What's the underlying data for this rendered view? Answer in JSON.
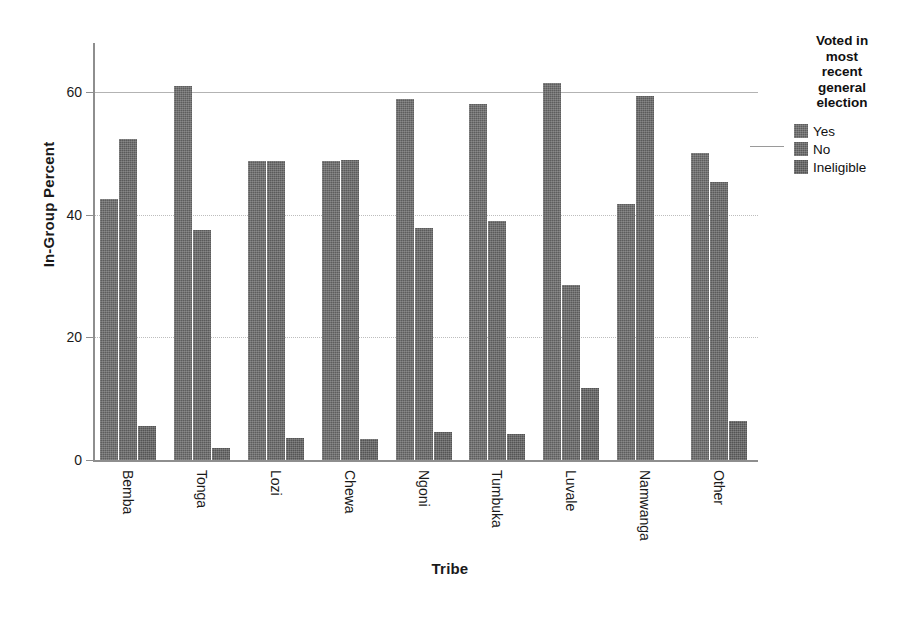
{
  "chart_data": {
    "type": "bar",
    "title": "",
    "xlabel": "Tribe",
    "ylabel": "In-Group Percent",
    "categories": [
      "Bemba",
      "Tonga",
      "Lozi",
      "Chewa",
      "Ngoni",
      "Tumbuka",
      "Luvale",
      "Namwanga",
      "Other"
    ],
    "series": [
      {
        "name": "Yes",
        "values": [
          42.5,
          61.0,
          48.7,
          48.8,
          58.8,
          58.1,
          61.5,
          41.7,
          50.1
        ]
      },
      {
        "name": "No",
        "values": [
          52.4,
          37.5,
          48.8,
          48.9,
          37.8,
          39.0,
          28.5,
          59.3,
          45.3
        ]
      },
      {
        "name": "Ineligible",
        "values": [
          5.5,
          2.0,
          3.6,
          3.5,
          4.6,
          4.3,
          11.8,
          0.0,
          6.3
        ]
      }
    ],
    "ylim": [
      0,
      68
    ],
    "yticks": [
      0,
      20,
      40,
      60
    ],
    "ytick_labels": [
      "0",
      "20",
      "40",
      "60"
    ],
    "grid": true,
    "grid_axis": "y",
    "legend_position": "right",
    "bar_color": "#5d5d5d",
    "axis_color": "#8e8e8e",
    "grid_color": "#c9c9c9"
  },
  "legend": {
    "title_lines": [
      "Voted in",
      "most",
      "recent",
      "general",
      "election"
    ],
    "items": [
      {
        "label": "Yes",
        "color": "#5d5d5d"
      },
      {
        "label": "No",
        "color": "#5a5a5a"
      },
      {
        "label": "Ineligible",
        "color": "#545454"
      }
    ]
  }
}
